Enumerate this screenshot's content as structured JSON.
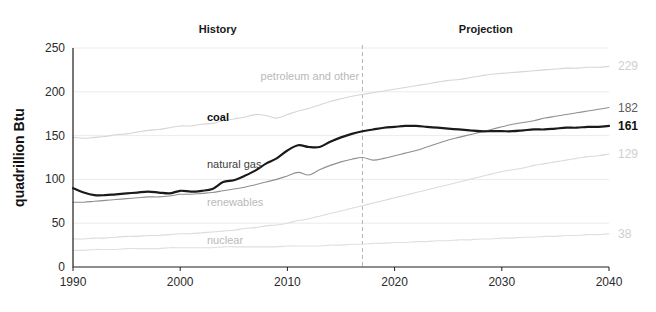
{
  "chart_data": {
    "type": "line",
    "title": "",
    "xlabel": "",
    "ylabel": "quadrillion Btu",
    "xlim": [
      1990,
      2040
    ],
    "ylim": [
      0,
      250
    ],
    "xticks": [
      "1990",
      "2000",
      "2010",
      "2020",
      "2030",
      "2040"
    ],
    "yticks": [
      "0",
      "50",
      "100",
      "150",
      "200",
      "250"
    ],
    "grid": true,
    "legend_position": "inline-labels",
    "annotations": {
      "history_label": "History",
      "projection_label": "Projection",
      "divider_year": 2017
    },
    "x": [
      1990,
      1991,
      1992,
      1993,
      1994,
      1995,
      1996,
      1997,
      1998,
      1999,
      2000,
      2001,
      2002,
      2003,
      2004,
      2005,
      2006,
      2007,
      2008,
      2009,
      2010,
      2011,
      2012,
      2013,
      2014,
      2015,
      2016,
      2017,
      2018,
      2019,
      2020,
      2021,
      2022,
      2023,
      2024,
      2025,
      2026,
      2027,
      2028,
      2029,
      2030,
      2031,
      2032,
      2033,
      2034,
      2035,
      2036,
      2037,
      2038,
      2039,
      2040
    ],
    "series": [
      {
        "name": "petroleum and other",
        "label": "petroleum and other",
        "label_style": "faint",
        "end_value": 229,
        "end_value_label": "229",
        "color": "#d6d6d6",
        "width": 1.1,
        "values": [
          148,
          147,
          148,
          149,
          151,
          152,
          154,
          156,
          157,
          159,
          161,
          161,
          163,
          164,
          167,
          169,
          171,
          174,
          173,
          170,
          174,
          178,
          181,
          185,
          189,
          192,
          195,
          197,
          199,
          201,
          203,
          205,
          207,
          209,
          211,
          213,
          214,
          216,
          218,
          220,
          221,
          222,
          223,
          224,
          225,
          226,
          227,
          227,
          228,
          228,
          229
        ]
      },
      {
        "name": "coal",
        "label": "coal",
        "label_style": "dark",
        "end_value": 161,
        "end_value_label": "161",
        "color": "#1a1a1a",
        "width": 2.2,
        "values": [
          90,
          85,
          82,
          82,
          83,
          84,
          85,
          86,
          85,
          84,
          87,
          86,
          87,
          89,
          97,
          99,
          104,
          110,
          118,
          124,
          133,
          139,
          137,
          137,
          143,
          148,
          152,
          155,
          157,
          159,
          160,
          161,
          161,
          160,
          159,
          158,
          157,
          156,
          155,
          155,
          155,
          155,
          156,
          157,
          157,
          158,
          159,
          159,
          160,
          160,
          161
        ]
      },
      {
        "name": "natural gas",
        "label": "natural gas",
        "label_style": "mid",
        "end_value": 182,
        "end_value_label": "182",
        "color": "#8f8f8f",
        "width": 1.1,
        "values": [
          74,
          74,
          75,
          76,
          77,
          78,
          79,
          80,
          80,
          81,
          83,
          83,
          84,
          85,
          87,
          89,
          91,
          94,
          97,
          100,
          104,
          108,
          105,
          111,
          116,
          120,
          123,
          125,
          122,
          124,
          127,
          130,
          133,
          137,
          141,
          145,
          148,
          151,
          154,
          157,
          160,
          163,
          165,
          167,
          170,
          172,
          174,
          176,
          178,
          180,
          182
        ]
      },
      {
        "name": "renewables",
        "label": "renewables",
        "label_style": "faint",
        "end_value": 129,
        "end_value_label": "129",
        "color": "#dcdcdc",
        "width": 1.1,
        "values": [
          32,
          32,
          33,
          33,
          34,
          35,
          35,
          36,
          36,
          37,
          38,
          38,
          39,
          40,
          41,
          42,
          44,
          45,
          47,
          48,
          50,
          53,
          55,
          58,
          61,
          64,
          67,
          70,
          73,
          76,
          79,
          82,
          85,
          88,
          91,
          94,
          97,
          100,
          103,
          106,
          109,
          111,
          113,
          116,
          118,
          120,
          122,
          124,
          126,
          127,
          129
        ]
      },
      {
        "name": "nuclear",
        "label": "nuclear",
        "label_style": "faint",
        "end_value": 38,
        "end_value_label": "38",
        "color": "#e0e0e0",
        "width": 1.1,
        "values": [
          19,
          19,
          20,
          20,
          20,
          21,
          21,
          21,
          21,
          22,
          22,
          22,
          22,
          22,
          23,
          23,
          23,
          23,
          23,
          23,
          24,
          24,
          24,
          24,
          25,
          25,
          26,
          26,
          27,
          27,
          28,
          28,
          29,
          29,
          30,
          30,
          31,
          31,
          32,
          32,
          33,
          33,
          34,
          34,
          35,
          35,
          36,
          36,
          37,
          37,
          38
        ]
      }
    ],
    "series_label_positions": [
      {
        "name": "petroleum and other",
        "x": 2007.5,
        "y": 214
      },
      {
        "name": "coal",
        "x": 2002.5,
        "y": 167
      },
      {
        "name": "natural gas",
        "x": 2002.5,
        "y": 113
      },
      {
        "name": "renewables",
        "x": 2002.5,
        "y": 70
      },
      {
        "name": "nuclear",
        "x": 2002.5,
        "y": 26
      }
    ]
  }
}
